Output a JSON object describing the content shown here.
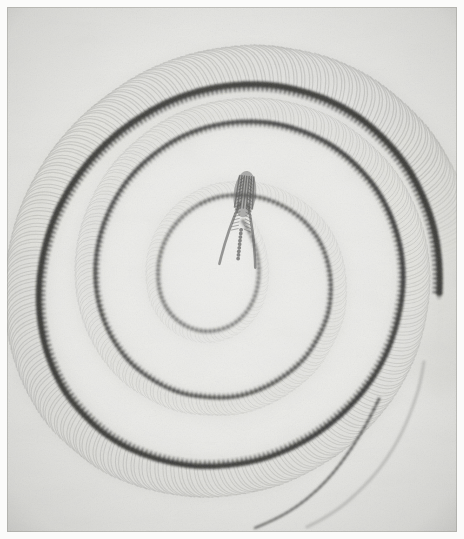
{
  "figure": {
    "kind": "radiograph",
    "subject_label": "coiled snake skeleton",
    "medium_label": "x-ray photographic plate",
    "caption": "",
    "title": "",
    "border_color": "#fbfbfa",
    "plate_background": "#e9e9e6",
    "bone_color": "#4a4a48",
    "dark_bone_color": "#2e2e2c",
    "faint_bone_color": "#8f8f8c",
    "soft_tissue_color": "#d7d7d2"
  },
  "chart_data": {
    "type": "scatter",
    "title": "",
    "xlabel": "",
    "ylabel": "",
    "grid": false,
    "legend_position": "none",
    "xlim": [
      0,
      450
    ],
    "ylim": [
      0,
      525
    ],
    "spiral": {
      "center_x": 228,
      "center_y": 250,
      "turns": 2.6,
      "theta_start_deg": 95,
      "theta_end_deg": 1040,
      "radius_start": 34,
      "radius_end": 232
    },
    "series": [
      {
        "name": "vertebral column (spine)",
        "role": "spine",
        "opacity": 1.0,
        "values": [
          [
            236,
            214
          ],
          [
            244,
            228
          ],
          [
            250,
            246
          ],
          [
            252,
            266
          ],
          [
            249,
            286
          ],
          [
            241,
            303
          ],
          [
            228,
            316
          ],
          [
            212,
            323
          ],
          [
            194,
            324
          ],
          [
            177,
            318
          ],
          [
            163,
            306
          ],
          [
            154,
            289
          ],
          [
            151,
            269
          ],
          [
            153,
            248
          ],
          [
            161,
            228
          ],
          [
            174,
            211
          ],
          [
            191,
            198
          ],
          [
            211,
            190
          ],
          [
            233,
            188
          ],
          [
            256,
            191
          ],
          [
            278,
            200
          ],
          [
            297,
            214
          ],
          [
            312,
            233
          ],
          [
            321,
            256
          ],
          [
            324,
            281
          ],
          [
            321,
            307
          ],
          [
            311,
            331
          ],
          [
            296,
            353
          ],
          [
            276,
            370
          ],
          [
            252,
            383
          ],
          [
            226,
            390
          ],
          [
            198,
            390
          ],
          [
            171,
            385
          ],
          [
            146,
            373
          ],
          [
            124,
            356
          ],
          [
            107,
            334
          ],
          [
            95,
            308
          ],
          [
            89,
            280
          ],
          [
            89,
            251
          ],
          [
            95,
            222
          ],
          [
            107,
            194
          ],
          [
            124,
            169
          ],
          [
            146,
            148
          ],
          [
            172,
            131
          ],
          [
            201,
            120
          ],
          [
            232,
            115
          ],
          [
            264,
            116
          ],
          [
            295,
            124
          ],
          [
            324,
            138
          ],
          [
            349,
            158
          ],
          [
            370,
            183
          ],
          [
            385,
            212
          ],
          [
            394,
            244
          ],
          [
            396,
            278
          ],
          [
            391,
            312
          ],
          [
            380,
            345
          ],
          [
            363,
            375
          ],
          [
            341,
            401
          ],
          [
            315,
            423
          ],
          [
            286,
            440
          ],
          [
            255,
            452
          ],
          [
            223,
            458
          ],
          [
            190,
            459
          ],
          [
            158,
            454
          ],
          [
            128,
            444
          ],
          [
            101,
            429
          ],
          [
            78,
            409
          ],
          [
            59,
            386
          ],
          [
            45,
            359
          ],
          [
            36,
            330
          ],
          [
            32,
            299
          ],
          [
            33,
            268
          ],
          [
            39,
            236
          ],
          [
            50,
            205
          ],
          [
            66,
            176
          ],
          [
            86,
            150
          ],
          [
            110,
            127
          ],
          [
            137,
            108
          ],
          [
            166,
            93
          ],
          [
            197,
            83
          ],
          [
            229,
            78
          ],
          [
            262,
            78
          ],
          [
            294,
            84
          ],
          [
            325,
            95
          ],
          [
            354,
            112
          ],
          [
            379,
            134
          ],
          [
            400,
            160
          ],
          [
            416,
            190
          ],
          [
            427,
            222
          ],
          [
            432,
            256
          ],
          [
            432,
            290
          ],
          [
            427,
            323
          ],
          [
            417,
            355
          ]
        ]
      },
      {
        "name": "outer tail coil (faint, ribless)",
        "role": "tail-outer",
        "opacity": 0.42,
        "values": [
          [
            417,
            355
          ],
          [
            412,
            380
          ],
          [
            404,
            404
          ],
          [
            394,
            427
          ],
          [
            382,
            448
          ],
          [
            368,
            467
          ],
          [
            352,
            484
          ],
          [
            335,
            499
          ],
          [
            317,
            511
          ],
          [
            300,
            520
          ]
        ]
      },
      {
        "name": "tail tip",
        "role": "tail-tip",
        "opacity": 0.8,
        "values": [
          [
            372,
            392
          ],
          [
            362,
            412
          ],
          [
            351,
            431
          ],
          [
            339,
            449
          ],
          [
            326,
            466
          ],
          [
            312,
            481
          ],
          [
            297,
            494
          ],
          [
            281,
            505
          ],
          [
            264,
            514
          ],
          [
            248,
            521
          ]
        ]
      }
    ],
    "skull": {
      "name": "skull and mandible",
      "x": 236,
      "y": 205,
      "length": 86,
      "width": 34,
      "angle_deg": 96,
      "parts": [
        "cranium",
        "left mandible",
        "right mandible",
        "quadrate",
        "cervical vertebrae"
      ]
    },
    "ribs": {
      "name": "rib arcs",
      "count_per_side": 230,
      "spacing_px": 4.0,
      "arc_span_deg": 118,
      "opacity": 0.3
    }
  }
}
